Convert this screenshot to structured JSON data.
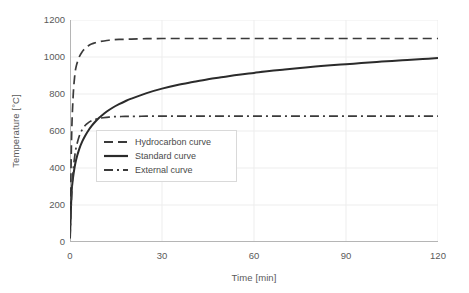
{
  "chart_data": {
    "type": "line",
    "title": "",
    "xlabel": "Time [min]",
    "ylabel": "Temperature [°C]",
    "xlim": [
      0,
      120
    ],
    "ylim": [
      0,
      1200
    ],
    "xticks": [
      0,
      30,
      60,
      90,
      120
    ],
    "yticks": [
      0,
      200,
      400,
      600,
      800,
      1000,
      1200
    ],
    "xtick_labels": [
      "0",
      "30",
      "60",
      "90",
      "120"
    ],
    "ytick_labels": [
      "0",
      "200",
      "400",
      "600",
      "800",
      "1000",
      "1200"
    ],
    "grid": true,
    "legend_position": "center-left",
    "x": [
      0,
      0.5,
      1,
      1.5,
      2,
      3,
      4,
      5,
      6,
      7,
      8,
      9,
      10,
      12,
      14,
      16,
      18,
      20,
      25,
      30,
      35,
      40,
      45,
      50,
      55,
      60,
      65,
      70,
      75,
      80,
      85,
      90,
      95,
      100,
      105,
      110,
      115,
      120
    ],
    "series": [
      {
        "name": "Hydrocarbon curve",
        "style": "dashed",
        "color": "#3a3a3a",
        "values": [
          20,
          553,
          780,
          891,
          948,
          1000,
          1029,
          1048,
          1061,
          1070,
          1076,
          1081,
          1084,
          1089,
          1093,
          1095,
          1096,
          1097,
          1099,
          1100,
          1100,
          1100,
          1100,
          1100,
          1100,
          1100,
          1100,
          1100,
          1100,
          1100,
          1100,
          1100,
          1100,
          1100,
          1100,
          1100,
          1100,
          1100
        ]
      },
      {
        "name": "Standard curve",
        "style": "solid",
        "color": "#2b2b2b",
        "values": [
          20,
          261,
          349,
          404,
          445,
          502,
          544,
          576,
          603,
          626,
          646,
          663,
          678,
          705,
          727,
          745,
          761,
          775,
          805,
          829,
          849,
          865,
          880,
          892,
          904,
          914,
          924,
          932,
          940,
          948,
          955,
          961,
          967,
          973,
          979,
          984,
          989,
          994
        ]
      },
      {
        "name": "External curve",
        "style": "dashdot",
        "color": "#3a3a3a",
        "values": [
          20,
          240,
          380,
          458,
          510,
          572,
          608,
          631,
          645,
          655,
          662,
          666,
          670,
          674,
          677,
          678,
          679,
          679,
          680,
          680,
          680,
          680,
          680,
          680,
          680,
          680,
          680,
          680,
          680,
          680,
          680,
          680,
          680,
          680,
          680,
          680,
          680,
          680
        ]
      }
    ]
  },
  "legend": {
    "items": [
      {
        "label": "Hydrocarbon curve",
        "style": "dashed"
      },
      {
        "label": "Standard curve",
        "style": "solid"
      },
      {
        "label": "External curve",
        "style": "dashdot"
      }
    ]
  },
  "colors": {
    "grid": "#ededed",
    "axis": "#b5b5b5",
    "text": "#5a5a5a",
    "curve_dark": "#2b2b2b",
    "curve_mid": "#3a3a3a",
    "legend_border": "#d9d9d9",
    "background": "#ffffff"
  }
}
